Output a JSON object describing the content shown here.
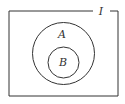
{
  "diagram": {
    "type": "venn",
    "universe": {
      "label": "I"
    },
    "sets": [
      {
        "label": "A"
      },
      {
        "label": "B"
      }
    ],
    "relation": "B is a subset of A, A is a subset of I"
  },
  "colors": {
    "stroke": "#333333",
    "background": "#ffffff"
  }
}
